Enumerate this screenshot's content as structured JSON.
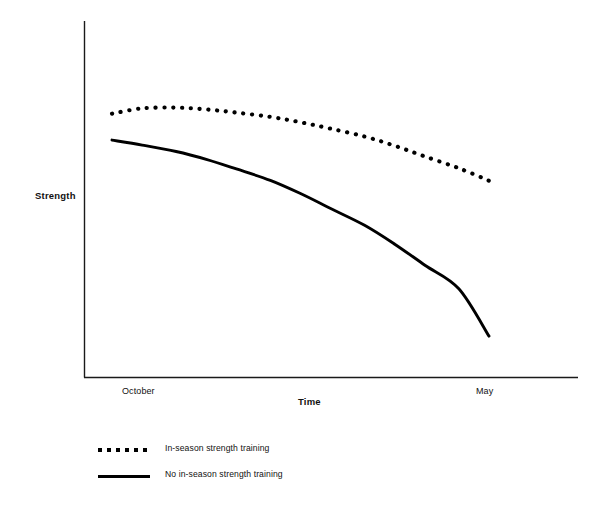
{
  "chart_data": {
    "type": "line",
    "title": "",
    "xlabel": "Time",
    "ylabel": "Strength",
    "x_tick_labels": [
      "October",
      "May"
    ],
    "y_tick_labels": [],
    "grid": false,
    "legend_position": "below-left",
    "xlim": [
      0,
      1
    ],
    "ylim": [
      0,
      1
    ],
    "series": [
      {
        "name": "In-season strength training",
        "style": "dotted",
        "color": "#000000",
        "x": [
          0.0,
          0.08,
          0.17,
          0.25,
          0.33,
          0.42,
          0.5,
          0.58,
          0.67,
          0.75,
          0.83,
          0.92,
          1.0
        ],
        "values": [
          0.74,
          0.755,
          0.757,
          0.752,
          0.743,
          0.731,
          0.716,
          0.698,
          0.676,
          0.65,
          0.62,
          0.587,
          0.552
        ]
      },
      {
        "name": "No in-season strength training",
        "style": "solid",
        "color": "#000000",
        "x": [
          0.0,
          0.08,
          0.17,
          0.25,
          0.33,
          0.42,
          0.5,
          0.58,
          0.67,
          0.75,
          0.83,
          0.92,
          1.0
        ],
        "values": [
          0.666,
          0.652,
          0.634,
          0.612,
          0.585,
          0.553,
          0.516,
          0.474,
          0.427,
          0.374,
          0.315,
          0.249,
          0.116
        ]
      }
    ],
    "annotations": []
  },
  "axes": {
    "y_label": "Strength",
    "x_label": "Time",
    "x_tick_start": "October",
    "x_tick_end": "May"
  },
  "legend": {
    "items": [
      {
        "label": "In-season strength training",
        "style": "dotted"
      },
      {
        "label": "No in-season strength training",
        "style": "solid"
      }
    ]
  },
  "colors": {
    "axis": "#1a1a1a",
    "line": "#000000",
    "background": "#ffffff"
  }
}
